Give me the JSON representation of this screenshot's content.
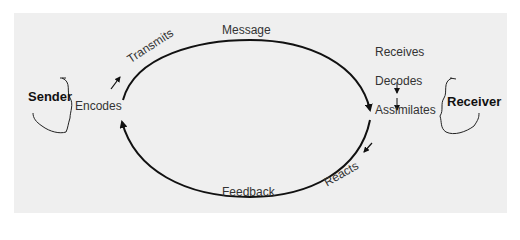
{
  "diagram": {
    "sender": {
      "label": "Sender",
      "action": "Encodes"
    },
    "receiver": {
      "label": "Receiver",
      "steps": [
        "Receives",
        "Decodes",
        "Assimilates"
      ]
    },
    "top_arc": {
      "label": "Message",
      "direction_label": "Transmits"
    },
    "bottom_arc": {
      "label": "Feedback",
      "direction_label": "Reacts"
    },
    "colors": {
      "background": "#efefef",
      "line": "#111111",
      "text": "#333333"
    }
  }
}
